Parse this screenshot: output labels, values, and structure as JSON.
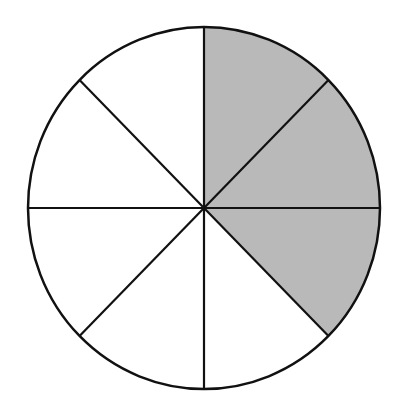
{
  "diagram": {
    "type": "fraction-circle",
    "total_parts": 8,
    "shaded_parts": 3,
    "shaded_fraction": "3/8",
    "shaded_sectors": [
      0,
      1,
      2
    ],
    "colors": {
      "shaded": "#b9b9b9",
      "unshaded": "#ffffff",
      "stroke": "#111111"
    }
  }
}
